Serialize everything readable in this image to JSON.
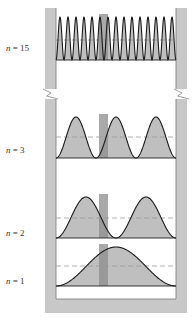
{
  "figure": {
    "title": "",
    "colors": {
      "wall": "#c8c8c8",
      "fill": "#b4b4b4",
      "barrier": "#8c8c8c",
      "curve": "#1a1a1a",
      "dashed": "#999999",
      "baseline": "#222222"
    },
    "levels": [
      {
        "id": "n15",
        "label_var": "n",
        "label_eq": " = 15",
        "n": 15,
        "label_y": 50,
        "top": 17,
        "base": 60,
        "dash": 40
      },
      {
        "id": "n3",
        "label_var": "n",
        "label_eq": " = 3",
        "n": 3,
        "label_y": 152,
        "top": 117,
        "base": 158,
        "dash": 137
      },
      {
        "id": "n2",
        "label_var": "n",
        "label_eq": " = 2",
        "n": 2,
        "label_y": 235,
        "top": 197,
        "base": 238,
        "dash": 218
      },
      {
        "id": "n1",
        "label_var": "n",
        "label_eq": " = 1",
        "n": 1,
        "label_y": 283,
        "top": 247,
        "base": 286,
        "dash": 266
      }
    ],
    "box": {
      "left": 56,
      "right": 176,
      "wall_width": 11,
      "bottom": 299
    },
    "barrier": {
      "x": 99,
      "width": 9
    },
    "break": {
      "y": 94
    }
  }
}
